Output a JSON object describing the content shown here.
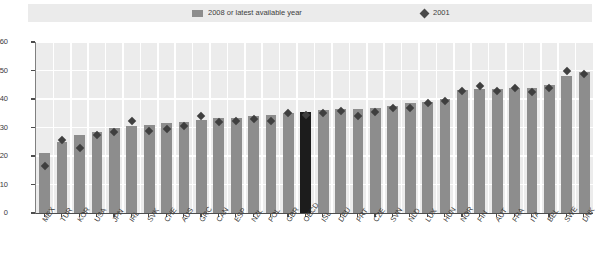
{
  "legend": {
    "bars_label": "2008 or latest available year",
    "points_label": "2001",
    "bar_color": "#8d8d8d",
    "point_color": "#3f3f3f",
    "highlight_color": "#1c1c1c",
    "background": "#ebebeb"
  },
  "axis": {
    "y_ticks": [
      "0",
      "10",
      "20",
      "30",
      "40",
      "50",
      "60"
    ],
    "x_label": "",
    "y_label": ""
  },
  "chart_data": {
    "type": "bar",
    "title": "",
    "subtitle": "",
    "xlabel": "",
    "ylabel": "",
    "ylim": [
      0,
      60
    ],
    "ytick_step": 10,
    "grid": true,
    "legend_position": "top",
    "highlight_category": "OECD",
    "categories": [
      "MEX",
      "TUR",
      "KOR",
      "USA",
      "JPN",
      "IRL",
      "SVK",
      "CHE",
      "AUS",
      "GRC",
      "CAN",
      "ESP",
      "NZL",
      "POL",
      "GBR",
      "OECD",
      "ISL",
      "DEU",
      "PRT",
      "CZE",
      "SVN",
      "NLD",
      "LUX",
      "HUN",
      "NOR",
      "FIN",
      "AUT",
      "FRA",
      "ITA",
      "BEL",
      "SWE",
      "DNK"
    ],
    "series": [
      {
        "name": "2008 or latest available year",
        "type": "bar",
        "color": "#8d8d8d",
        "values": [
          21.0,
          25.0,
          27.5,
          28.5,
          30.0,
          30.5,
          31.0,
          31.5,
          32.0,
          32.5,
          33.5,
          33.5,
          34.0,
          34.5,
          35.0,
          35.5,
          36.0,
          36.5,
          36.5,
          37.0,
          37.5,
          38.5,
          39.0,
          40.0,
          43.0,
          43.5,
          43.5,
          44.0,
          44.0,
          45.0,
          48.0,
          49.5
        ]
      },
      {
        "name": "2001",
        "type": "scatter",
        "marker": "diamond",
        "color": "#3f3f3f",
        "values": [
          17.5,
          26.5,
          24.0,
          28.5,
          29.5,
          33.5,
          30.0,
          30.5,
          31.5,
          35.0,
          33.0,
          33.5,
          34.0,
          33.5,
          36.0,
          35.5,
          36.0,
          37.0,
          35.0,
          36.5,
          38.0,
          38.0,
          39.5,
          40.5,
          44.0,
          45.5,
          44.0,
          45.0,
          43.5,
          45.0,
          51.0,
          50.0
        ]
      }
    ]
  }
}
